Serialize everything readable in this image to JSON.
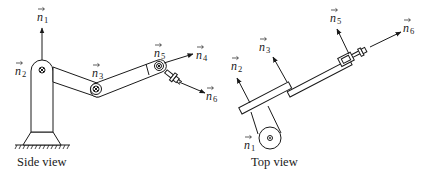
{
  "figure": {
    "side_view": {
      "caption": "Side view",
      "vectors": [
        {
          "id": "n1",
          "base": "n",
          "sub": "1"
        },
        {
          "id": "n2",
          "base": "n",
          "sub": "2"
        },
        {
          "id": "n3",
          "base": "n",
          "sub": "3"
        },
        {
          "id": "n4",
          "base": "n",
          "sub": "4"
        },
        {
          "id": "n5",
          "base": "n",
          "sub": "5"
        },
        {
          "id": "n6",
          "base": "n",
          "sub": "6"
        }
      ]
    },
    "top_view": {
      "caption": "Top view",
      "vectors": [
        {
          "id": "n1",
          "base": "n",
          "sub": "1"
        },
        {
          "id": "n2",
          "base": "n",
          "sub": "2"
        },
        {
          "id": "n3",
          "base": "n",
          "sub": "3"
        },
        {
          "id": "n5",
          "base": "n",
          "sub": "5"
        },
        {
          "id": "n6",
          "base": "n",
          "sub": "6"
        }
      ]
    },
    "arrow_symbol": "→"
  }
}
